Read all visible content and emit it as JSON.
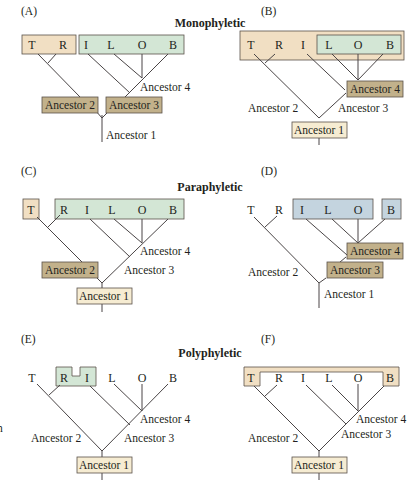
{
  "colors": {
    "tan_fill": "#f1dfc3",
    "green_fill": "#d3e6d5",
    "blue_fill": "#c4d4df",
    "brown_fill": "#c2b18b",
    "pale_fill": "#f6ecd2",
    "box_stroke": "#5a524a",
    "line": "#4a4546"
  },
  "sections": {
    "monophyletic": "Monophyletic",
    "paraphyletic": "Paraphyletic",
    "polyphyletic": "Polyphyletic"
  },
  "panels": {
    "A": {
      "label": "(A)",
      "taxa": [
        "T",
        "R",
        "I",
        "L",
        "O",
        "B"
      ],
      "ancestors": [
        "Ancestor 1",
        "Ancestor 2",
        "Ancestor 3",
        "Ancestor 4"
      ]
    },
    "B": {
      "label": "(B)",
      "taxa": [
        "T",
        "R",
        "I",
        "L",
        "O",
        "B"
      ],
      "ancestors": [
        "Ancestor 1",
        "Ancestor 2",
        "Ancestor 3",
        "Ancestor 4"
      ]
    },
    "C": {
      "label": "(C)",
      "taxa": [
        "T",
        "R",
        "I",
        "L",
        "O",
        "B"
      ],
      "ancestors": [
        "Ancestor 1",
        "Ancestor 2",
        "Ancestor 3",
        "Ancestor 4"
      ]
    },
    "D": {
      "label": "(D)",
      "taxa": [
        "T",
        "R",
        "I",
        "L",
        "O",
        "B"
      ],
      "ancestors": [
        "Ancestor 1",
        "Ancestor 2",
        "Ancestor 3",
        "Ancestor 4"
      ]
    },
    "E": {
      "label": "(E)",
      "taxa": [
        "T",
        "R",
        "I",
        "L",
        "O",
        "B"
      ],
      "ancestors": [
        "Ancestor 1",
        "Ancestor 2",
        "Ancestor 3",
        "Ancestor 4"
      ]
    },
    "F": {
      "label": "(F)",
      "taxa": [
        "T",
        "R",
        "I",
        "L",
        "O",
        "B"
      ],
      "ancestors": [
        "Ancestor 1",
        "Ancestor 2",
        "Ancestor 3",
        "Ancestor 4"
      ]
    }
  },
  "edge_fragments": [
    "n"
  ]
}
